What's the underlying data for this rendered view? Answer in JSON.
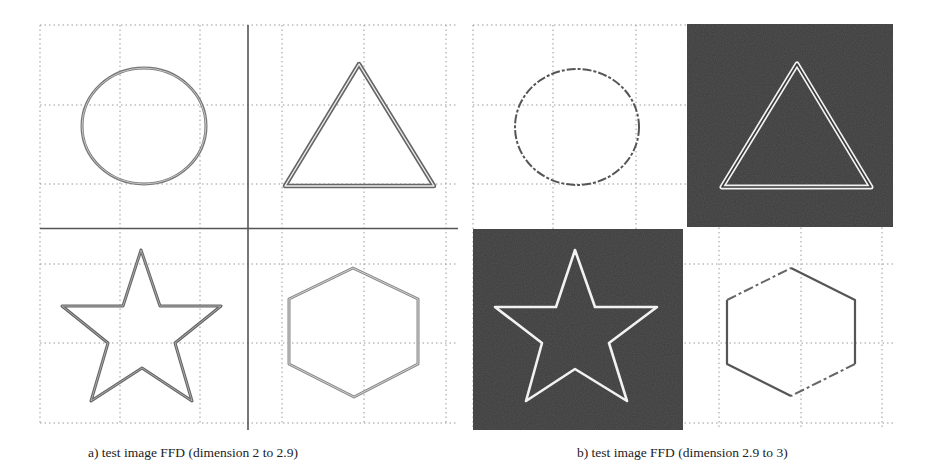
{
  "figure": {
    "panels": [
      {
        "id": "a",
        "caption": "a) test image FFD (dimension 2 to 2.9)",
        "description": "Four shapes on dotted grid separated by solid quadrant lines; shapes outlined with double gray lines",
        "shapes": [
          "circle",
          "triangle",
          "star",
          "hexagon"
        ],
        "highlighted_quadrants": []
      },
      {
        "id": "b",
        "caption": "b) test image FFD (dimension 2.9 to 3)",
        "description": "Same four shapes; triangle and star quadrants shaded dark with white outlines",
        "shapes": [
          "circle",
          "triangle",
          "star",
          "hexagon"
        ],
        "highlighted_quadrants": [
          "triangle",
          "star"
        ]
      }
    ],
    "colors": {
      "grid": "#9a9a9a",
      "axis_line": "#555555",
      "shape_stroke": "#666666",
      "dark_fill": "#3a3a3a",
      "light_stroke": "#f2f2f2"
    }
  }
}
